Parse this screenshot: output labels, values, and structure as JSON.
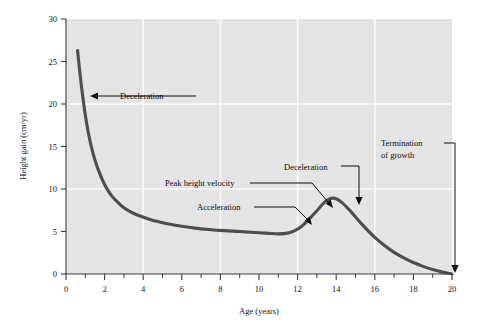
{
  "chart_data": {
    "type": "line",
    "title": "",
    "subtitle": "",
    "xlabel": "Age (years)",
    "ylabel": "Height gain (cm/yr)",
    "xlim": [
      0,
      20
    ],
    "ylim": [
      0,
      30
    ],
    "x_ticks": [
      0,
      2,
      4,
      6,
      8,
      10,
      12,
      14,
      16,
      18,
      20
    ],
    "x_tick_labels": [
      "0",
      "2",
      "4",
      "6",
      "8",
      "10",
      "12",
      "14",
      "16",
      "18",
      "20"
    ],
    "x_minor_ticks": [
      1,
      3,
      5,
      7,
      9,
      11,
      13,
      15,
      17,
      19
    ],
    "y_ticks": [
      0,
      5,
      10,
      15,
      20,
      25,
      30
    ],
    "y_tick_labels": [
      "0",
      "5",
      "10",
      "15",
      "20",
      "25",
      "30"
    ],
    "x_gridlines": [
      4,
      8,
      12,
      16
    ],
    "y_gridlines": [
      10,
      20
    ],
    "grid": true,
    "legend": null,
    "plot_background": "#e4e4e4",
    "gridline_color": "#fbfbfb",
    "curve_color": "#4d4d4d",
    "series": [
      {
        "name": "Height velocity",
        "points": [
          [
            0.6,
            26.3
          ],
          [
            0.7,
            24.1
          ],
          [
            0.8,
            22.1
          ],
          [
            0.9,
            20.3
          ],
          [
            1.0,
            18.7
          ],
          [
            1.15,
            16.7
          ],
          [
            1.3,
            15.1
          ],
          [
            1.5,
            13.4
          ],
          [
            1.7,
            12.1
          ],
          [
            1.9,
            11.0
          ],
          [
            2.1,
            10.1
          ],
          [
            2.4,
            9.1
          ],
          [
            2.7,
            8.4
          ],
          [
            3.0,
            7.8
          ],
          [
            3.4,
            7.25
          ],
          [
            3.8,
            6.85
          ],
          [
            4.3,
            6.45
          ],
          [
            4.8,
            6.15
          ],
          [
            5.4,
            5.85
          ],
          [
            6.0,
            5.62
          ],
          [
            6.7,
            5.4
          ],
          [
            7.4,
            5.24
          ],
          [
            8.2,
            5.1
          ],
          [
            9.0,
            5.0
          ],
          [
            9.8,
            4.88
          ],
          [
            10.5,
            4.78
          ],
          [
            11.0,
            4.72
          ],
          [
            11.4,
            4.78
          ],
          [
            11.8,
            5.05
          ],
          [
            12.2,
            5.6
          ],
          [
            12.6,
            6.45
          ],
          [
            13.0,
            7.45
          ],
          [
            13.4,
            8.45
          ],
          [
            13.7,
            8.88
          ],
          [
            14.0,
            8.85
          ],
          [
            14.3,
            8.4
          ],
          [
            14.7,
            7.5
          ],
          [
            15.1,
            6.45
          ],
          [
            15.5,
            5.45
          ],
          [
            16.0,
            4.3
          ],
          [
            16.5,
            3.35
          ],
          [
            17.0,
            2.55
          ],
          [
            17.5,
            1.9
          ],
          [
            18.0,
            1.35
          ],
          [
            18.5,
            0.9
          ],
          [
            19.0,
            0.52
          ],
          [
            19.5,
            0.22
          ],
          [
            19.9,
            0.05
          ],
          [
            20.0,
            0.0
          ]
        ]
      }
    ],
    "annotations": [
      {
        "id": "deceleration-infancy",
        "label": "Deceleration",
        "text_x": 120,
        "text_y": 99,
        "anchor": "start",
        "leader": "M 196 96 L 98 96",
        "arrow_tip_x": 90,
        "arrow_tip_y": 96,
        "arrow_dir": "left"
      },
      {
        "id": "peak-height-velocity",
        "label": "Peak height velocity",
        "text_x": 165,
        "text_y": 186,
        "anchor": "start",
        "leader": "M 250 183 L 312 183 L 328 202",
        "arrow_tip_x": 333,
        "arrow_tip_y": 208,
        "arrow_dir": "down-right"
      },
      {
        "id": "acceleration",
        "label": "Acceleration",
        "text_x": 197,
        "text_y": 210,
        "anchor": "start",
        "leader": "M 254 207 L 295 207 L 307 219",
        "arrow_tip_x": 312,
        "arrow_tip_y": 225,
        "arrow_dir": "down-right"
      },
      {
        "id": "deceleration-puberty",
        "label": "Deceleration",
        "text_x": 284,
        "text_y": 170,
        "anchor": "start",
        "leader": "M 341 166 L 359 166 L 359 197",
        "arrow_tip_x": 359,
        "arrow_tip_y": 205,
        "arrow_dir": "down"
      },
      {
        "id": "termination-of-growth",
        "label_line1": "Termination",
        "label_line2": "of growth",
        "text_x": 381,
        "text_y": 146,
        "anchor": "start",
        "leader": "M 444 143 L 455 143 L 455 265",
        "arrow_tip_x": 455,
        "arrow_tip_y": 273,
        "arrow_dir": "down"
      }
    ]
  },
  "figure": {
    "background": "#ffffff"
  }
}
